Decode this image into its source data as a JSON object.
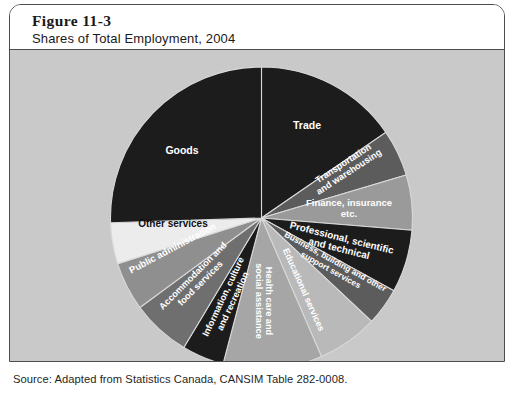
{
  "figure": {
    "number": "Figure 11-3",
    "title": "Shares of Total Employment, 2004",
    "source": "Source: Adapted from Statistics Canada, CANSIM Table 282-0008."
  },
  "chart_data": {
    "type": "pie",
    "title": "Shares of Total Employment, 2004",
    "subtitle": "Figure 11-3",
    "units": "percent of total employment",
    "legend": "none (labels drawn inside slices)",
    "start_angle_deg": -90,
    "direction": "clockwise",
    "categories": [
      "Trade",
      "Transportation and warehousing",
      "Finance, insurance etc.",
      "Professional, scientific and technical",
      "Business, building and other support services",
      "Educational services",
      "Health care and social assistance",
      "Information, culture and recreation",
      "Accommodation and food services",
      "Public administration",
      "Other services",
      "Goods"
    ],
    "values": [
      15.4,
      5.0,
      5.9,
      6.7,
      4.0,
      6.5,
      10.6,
      4.5,
      6.3,
      5.2,
      4.4,
      25.5
    ],
    "colors": [
      "#1c1c1c",
      "#5c5c5c",
      "#9a9a9a",
      "#1c1c1c",
      "#5c5c5c",
      "#b9b9b9",
      "#a6a6a6",
      "#1c1c1c",
      "#6f6f6f",
      "#8f8f8f",
      "#ececec",
      "#1c1c1c"
    ],
    "label_colors": [
      "#ffffff",
      "#ffffff",
      "#ffffff",
      "#ffffff",
      "#ffffff",
      "#ffffff",
      "#ffffff",
      "#ffffff",
      "#ffffff",
      "#ffffff",
      "#111111",
      "#ffffff"
    ],
    "background": "#c9c9c9"
  },
  "slices": [
    {
      "label_lines": [
        "Trade"
      ],
      "font_size": 10.5,
      "label_x": 306,
      "label_y": 128,
      "rotate": 0,
      "line_height": 11
    },
    {
      "label_lines": [
        "Transportation",
        "and warehousing"
      ],
      "font_size": 9.2,
      "label_x": 344,
      "label_y": 165,
      "rotate": -33,
      "line_height": 10
    },
    {
      "label_lines": [
        "Finance, insurance",
        "etc."
      ],
      "font_size": 9.5,
      "label_x": 348,
      "label_y": 205,
      "rotate": 0,
      "line_height": 11
    },
    {
      "label_lines": [
        "Professional, scientific",
        "and technical"
      ],
      "font_size": 9.8,
      "label_x": 340,
      "label_y": 240,
      "rotate": 14,
      "line_height": 11
    },
    {
      "label_lines": [
        "Business, building and other",
        "support services"
      ],
      "font_size": 8.4,
      "label_x": 333,
      "label_y": 263,
      "rotate": 29,
      "line_height": 9.5
    },
    {
      "label_lines": [
        "Educational services"
      ],
      "font_size": 9,
      "label_x": 300,
      "label_y": 290,
      "rotate": 66,
      "line_height": 10
    },
    {
      "label_lines": [
        "Health care and",
        "social assistance"
      ],
      "font_size": 9.2,
      "label_x": 265,
      "label_y": 300,
      "rotate": 90,
      "line_height": 10.5
    },
    {
      "label_lines": [
        "Information, culture",
        "and recreation"
      ],
      "font_size": 9.2,
      "label_x": 225,
      "label_y": 297,
      "rotate": -65,
      "line_height": 10.5
    },
    {
      "label_lines": [
        "Accommodation and",
        "food services"
      ],
      "font_size": 9.2,
      "label_x": 194,
      "label_y": 277,
      "rotate": -45,
      "line_height": 10.5
    },
    {
      "label_lines": [
        "Public administration"
      ],
      "font_size": 9.5,
      "label_x": 173,
      "label_y": 250,
      "rotate": -28,
      "line_height": 10
    },
    {
      "label_lines": [
        "Other services"
      ],
      "font_size": 10,
      "label_x": 172,
      "label_y": 226,
      "rotate": 0,
      "line_height": 11
    },
    {
      "label_lines": [
        "Goods"
      ],
      "font_size": 10.5,
      "label_x": 181,
      "label_y": 153,
      "rotate": 0,
      "line_height": 11
    }
  ]
}
